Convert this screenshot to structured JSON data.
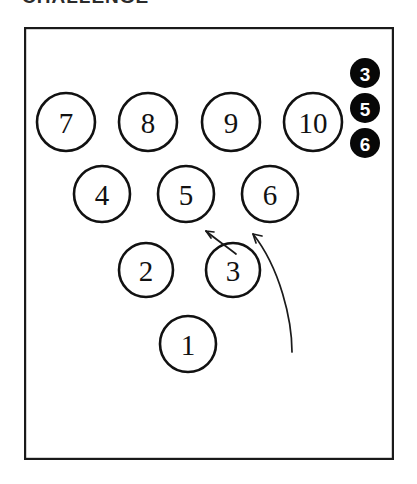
{
  "figure": {
    "caption_clipped": "CHALLENGE",
    "frame": {
      "x": 24,
      "y": 27,
      "width": 370,
      "height": 433
    },
    "background_color": "#ffffff",
    "outline_color": "#1a1a1a",
    "open_node_fill": "#ffffff",
    "filled_node_fill": "#070707",
    "filled_node_text_color": "#ffffff"
  },
  "triangle_nodes": [
    {
      "label": "7",
      "cx": 66,
      "cy": 122,
      "r": 29,
      "style": "open",
      "row": 4
    },
    {
      "label": "8",
      "cx": 148,
      "cy": 122,
      "r": 29,
      "style": "open",
      "row": 4
    },
    {
      "label": "9",
      "cx": 231,
      "cy": 122,
      "r": 29,
      "style": "open",
      "row": 4
    },
    {
      "label": "10",
      "cx": 313,
      "cy": 122,
      "r": 29,
      "style": "open",
      "row": 4
    },
    {
      "label": "4",
      "cx": 102,
      "cy": 194,
      "r": 28,
      "style": "open",
      "row": 3
    },
    {
      "label": "5",
      "cx": 186,
      "cy": 194,
      "r": 28,
      "style": "open",
      "row": 3
    },
    {
      "label": "6",
      "cx": 270,
      "cy": 194,
      "r": 28,
      "style": "open",
      "row": 3
    },
    {
      "label": "2",
      "cx": 146,
      "cy": 270,
      "r": 27,
      "style": "open",
      "row": 2
    },
    {
      "label": "3",
      "cx": 233,
      "cy": 270,
      "r": 27,
      "style": "open",
      "row": 2
    },
    {
      "label": "1",
      "cx": 188,
      "cy": 344,
      "r": 28,
      "style": "open",
      "row": 1
    }
  ],
  "marked_nodes": [
    {
      "label": "3",
      "cx": 365,
      "cy": 73,
      "r": 15,
      "style": "filled"
    },
    {
      "label": "5",
      "cx": 365,
      "cy": 108,
      "r": 15,
      "style": "filled"
    },
    {
      "label": "6",
      "cx": 365,
      "cy": 143,
      "r": 15,
      "style": "filled"
    }
  ],
  "arrows": [
    {
      "name": "short-arrow",
      "path": "M 236 254 C 226 246 214 238 206 231",
      "head": "M 206 231 L 211 238 M 206 231 L 214 232",
      "points_to": "5"
    },
    {
      "name": "long-arrow",
      "path": "M 292 352 C 292 320 280 268 253 234",
      "head": "M 253 234 L 256 243 M 253 234 L 262 236",
      "points_to": "6"
    }
  ]
}
